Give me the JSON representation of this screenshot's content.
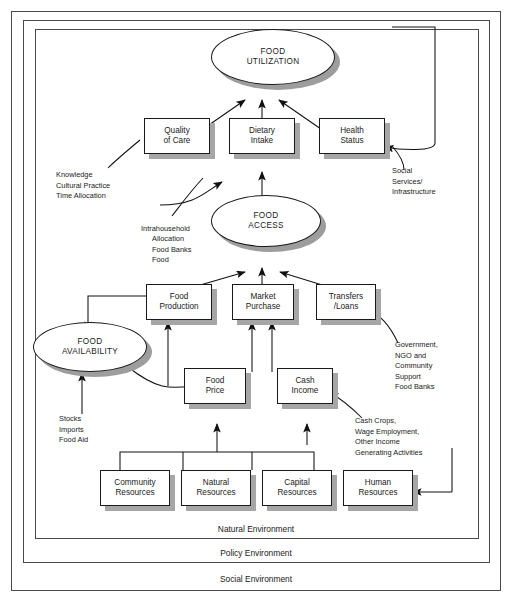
{
  "diagram": {
    "colors": {
      "line": "#1a1a1a",
      "shadow": "#a6a6a6",
      "ellipse_shadow": "#9d9d9d",
      "background": "#ffffff"
    },
    "ellipses": [
      {
        "id": "food-utilization",
        "label": "FOOD\nUTILIZATION"
      },
      {
        "id": "food-access",
        "label": "FOOD\nACCESS"
      },
      {
        "id": "food-availability",
        "label": "FOOD\nAVAILABILITY"
      }
    ],
    "boxes": [
      {
        "id": "quality-of-care",
        "label": "Quality\nof Care"
      },
      {
        "id": "dietary-intake",
        "label": "Dietary\nIntake"
      },
      {
        "id": "health-status",
        "label": "Health\nStatus"
      },
      {
        "id": "food-production",
        "label": "Food\nProduction"
      },
      {
        "id": "market-purchase",
        "label": "Market\nPurchase"
      },
      {
        "id": "transfers-loans",
        "label": "Transfers\n/Loans"
      },
      {
        "id": "food-price",
        "label": "Food\nPrice"
      },
      {
        "id": "cash-income",
        "label": "Cash\nIncome"
      },
      {
        "id": "community-resources",
        "label": "Community\nResources"
      },
      {
        "id": "natural-resources",
        "label": "Natural\nResources"
      },
      {
        "id": "capital-resources",
        "label": "Capital\nResources"
      },
      {
        "id": "human-resources",
        "label": "Human\nResources"
      }
    ],
    "annotations": [
      {
        "id": "knowledge-note",
        "label": "Knowledge\nCultural Practice\nTime Allocation"
      },
      {
        "id": "intrahousehold-note-head",
        "label": "Intrahousehold"
      },
      {
        "id": "intrahousehold-note-body",
        "label": "Allocation\nFood Banks\nFood"
      },
      {
        "id": "social-services-note",
        "label": "Social\nServices/\nInfrastructure"
      },
      {
        "id": "stocks-note",
        "label": "Stocks\nImports\nFood Aid"
      },
      {
        "id": "government-note",
        "label": "Government,\nNGO and\nCommunity\nSupport\nFood Banks"
      },
      {
        "id": "cash-crops-note",
        "label": "Cash Crops,\nWage Employment,\nOther Income\nGenerating Activities"
      }
    ],
    "environments": [
      {
        "id": "natural-environment",
        "label": "Natural Environment"
      },
      {
        "id": "policy-environment",
        "label": "Policy Environment"
      },
      {
        "id": "social-environment",
        "label": "Social Environment"
      }
    ]
  }
}
